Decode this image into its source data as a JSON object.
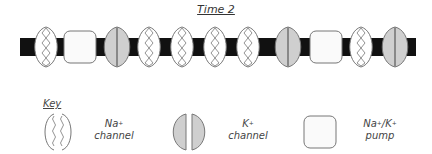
{
  "title": "Time 2",
  "membrane": {
    "sequence": [
      "na_channel",
      "pump",
      "k_channel",
      "na_channel",
      "na_channel",
      "na_channel",
      "na_channel",
      "k_channel",
      "pump",
      "na_channel",
      "k_channel"
    ],
    "colors": {
      "bar": "#111111",
      "k_fill": "#cfcfcf",
      "pump_fill": "#fafafa",
      "outline": "#777777"
    }
  },
  "key": {
    "title": "Key",
    "items": [
      {
        "id": "na",
        "name": "Na",
        "sup": "+",
        "sub": "channel"
      },
      {
        "id": "k",
        "name": "K",
        "sup": "+",
        "sub": "channel"
      },
      {
        "id": "pump",
        "name": "Na",
        "sup": "+",
        "mid": "/K",
        "sup2": "+",
        "sub": "pump"
      }
    ]
  }
}
